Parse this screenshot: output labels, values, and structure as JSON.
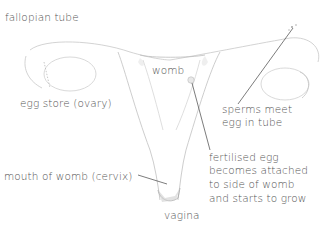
{
  "diagram": {
    "text_color": "#555555",
    "line_color": "#444444",
    "labels": {
      "fallopian_tube": "fallopian tube",
      "egg_store": "egg store (ovary)",
      "womb": "womb",
      "sperms_meet_1": "sperms meet",
      "sperms_meet_2": "egg in tube",
      "cervix": "mouth of womb (cervix)",
      "fertilised_1": "fertilised egg",
      "fertilised_2": "becomes attached",
      "fertilised_3": "to side of womb",
      "fertilised_4": "and starts to grow",
      "vagina": "vagina"
    }
  }
}
